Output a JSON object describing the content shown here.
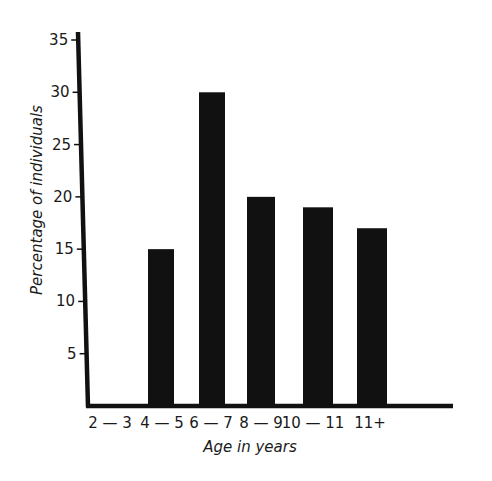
{
  "chart_data": {
    "type": "bar",
    "title": "",
    "xlabel": "Age in years",
    "ylabel": "Percentage of individuals",
    "categories": [
      "2 — 3",
      "4 — 5",
      "6 — 7",
      "8 — 9",
      "10 — 11",
      "11+"
    ],
    "values": [
      0,
      15,
      30,
      20,
      19,
      17
    ],
    "ylim": [
      0,
      35
    ],
    "yticks": [
      5,
      10,
      15,
      20,
      25,
      30,
      35
    ],
    "grid": false,
    "legend": null,
    "colors": {
      "bar": "#111111",
      "axis": "#111111",
      "text": "#1a1a1a",
      "background": "#ffffff"
    }
  }
}
